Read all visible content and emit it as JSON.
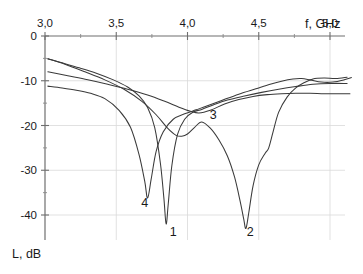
{
  "figure": {
    "background_color": "#ffffff",
    "curve_color": "#3a3a3a",
    "grid_color": "#d9d9d9",
    "axis_color": "#6e6e6e"
  },
  "axes": {
    "x_title": "f, GHz",
    "y_title": "L, dB",
    "x_tick_labels": [
      "3,0",
      "3,5",
      "4,0",
      "4,5",
      "5,0"
    ],
    "y_tick_labels": [
      "0",
      "-10",
      "-20",
      "-30",
      "-40"
    ]
  },
  "curve_labels": [
    {
      "text": "1"
    },
    {
      "text": "2"
    },
    {
      "text": "3"
    },
    {
      "text": "4"
    }
  ],
  "chart_data": {
    "type": "line",
    "title": "",
    "subtitle": "",
    "xlabel": "f, GHz",
    "ylabel": "L, dB",
    "xlim": [
      2.95,
      5.18
    ],
    "ylim": [
      -46,
      0
    ],
    "xticks": [
      3.0,
      3.5,
      4.0,
      4.5,
      5.0
    ],
    "xticklabels": [
      "3,0",
      "3,5",
      "4,0",
      "4,5",
      "5,0"
    ],
    "yticks": [
      0,
      -10,
      -20,
      -30,
      -40
    ],
    "yticklabels": [
      "0",
      "-10",
      "-20",
      "-30",
      "-40"
    ],
    "xtick_minor": [
      3.25,
      3.75,
      4.25,
      4.75
    ],
    "grid": true,
    "grid_axes": "both",
    "legend": false,
    "legend_position": "inline-curve-labels",
    "x_axis_position": "top",
    "y_axis_position": "left",
    "annotations": [
      {
        "text": "1",
        "x": 3.9,
        "y": -44.6,
        "describes_series": "1"
      },
      {
        "text": "2",
        "x": 4.44,
        "y": -44.6,
        "describes_series": "2"
      },
      {
        "text": "3",
        "x": 4.18,
        "y": -18.6,
        "describes_series": "3"
      },
      {
        "text": "4",
        "x": 3.7,
        "y": -38.3,
        "describes_series": "4"
      }
    ],
    "series": [
      {
        "name": "1",
        "label": "1",
        "minimum_db": -42.0,
        "minimum_freq_ghz": 3.85,
        "x": [
          3.02,
          3.12,
          3.24,
          3.36,
          3.48,
          3.58,
          3.66,
          3.72,
          3.77,
          3.81,
          3.835,
          3.85,
          3.865,
          3.89,
          3.93,
          3.98,
          4.04,
          4.1,
          4.18,
          4.28,
          4.4,
          4.52,
          4.64,
          4.76,
          4.88,
          5.0,
          5.12
        ],
        "y": [
          -5.1,
          -6.0,
          -7.1,
          -8.3,
          -9.8,
          -11.4,
          -13.4,
          -16.0,
          -20.5,
          -28.5,
          -36.5,
          -42.0,
          -37.5,
          -29.0,
          -22.0,
          -18.6,
          -17.0,
          -16.4,
          -15.4,
          -14.3,
          -13.4,
          -12.6,
          -11.9,
          -11.3,
          -10.8,
          -10.6,
          -10.6
        ]
      },
      {
        "name": "2",
        "label": "2",
        "minimum_db": -43.0,
        "minimum_freq_ghz": 4.4,
        "x": [
          3.02,
          3.14,
          3.28,
          3.42,
          3.56,
          3.68,
          3.78,
          3.86,
          3.92,
          3.96,
          4.0,
          4.05,
          4.1,
          4.16,
          4.22,
          4.28,
          4.33,
          4.37,
          4.395,
          4.41,
          4.43,
          4.46,
          4.5,
          4.545,
          4.57,
          4.6,
          4.64,
          4.7,
          4.76,
          4.82,
          4.88,
          4.96,
          5.04,
          5.12
        ],
        "y": [
          -5.1,
          -6.3,
          -8.0,
          -9.8,
          -12.0,
          -14.6,
          -17.6,
          -20.6,
          -22.2,
          -22.4,
          -21.9,
          -20.4,
          -19.2,
          -20.6,
          -23.2,
          -26.8,
          -31.5,
          -37.0,
          -41.0,
          -43.0,
          -39.5,
          -33.5,
          -28.8,
          -26.2,
          -25.0,
          -21.5,
          -17.0,
          -13.6,
          -11.6,
          -10.4,
          -9.6,
          -9.4,
          -9.5,
          -9.2
        ]
      },
      {
        "name": "3",
        "label": "3",
        "minimum_db": -17.2,
        "minimum_freq_ghz": 4.08,
        "x": [
          3.02,
          3.16,
          3.3,
          3.44,
          3.58,
          3.72,
          3.84,
          3.94,
          4.02,
          4.08,
          4.16,
          4.26,
          4.36,
          4.46,
          4.56,
          4.66,
          4.76,
          4.86,
          4.96,
          5.06,
          5.14
        ],
        "y": [
          -8.0,
          -8.9,
          -9.8,
          -10.8,
          -11.9,
          -13.2,
          -14.6,
          -15.9,
          -16.8,
          -17.2,
          -16.6,
          -15.2,
          -14.2,
          -13.5,
          -13.1,
          -12.9,
          -12.8,
          -12.8,
          -12.9,
          -12.9,
          -12.9
        ]
      },
      {
        "name": "4",
        "label": "4",
        "minimum_db": -36.2,
        "minimum_freq_ghz": 3.72,
        "x": [
          3.02,
          3.12,
          3.22,
          3.32,
          3.42,
          3.52,
          3.6,
          3.66,
          3.7,
          3.72,
          3.745,
          3.78,
          3.83,
          3.9,
          3.98,
          4.06,
          4.14,
          4.24,
          4.36,
          4.48,
          4.58,
          4.66,
          4.74,
          4.8,
          4.86,
          4.94,
          5.02,
          5.1,
          5.15
        ],
        "y": [
          -11.2,
          -11.6,
          -12.1,
          -12.8,
          -14.0,
          -16.6,
          -20.4,
          -26.5,
          -32.5,
          -36.2,
          -32.0,
          -25.8,
          -21.4,
          -18.6,
          -17.4,
          -16.5,
          -15.6,
          -14.4,
          -13.0,
          -11.8,
          -10.8,
          -10.1,
          -9.6,
          -9.5,
          -9.8,
          -10.3,
          -10.3,
          -9.8,
          -9.3
        ]
      }
    ]
  }
}
